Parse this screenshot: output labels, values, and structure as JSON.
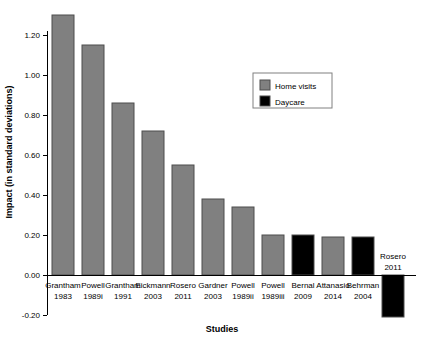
{
  "chart_data": {
    "type": "bar",
    "title": "",
    "xlabel": "Studies",
    "ylabel": "Impact (in standard deviations)",
    "categories": [
      "Grantham 1983",
      "Powell 1989i",
      "Grantham 1991",
      "Eickmann 2003",
      "Rosero 2011",
      "Gardner 2003",
      "Powell 1989ii",
      "Powell 1989iii",
      "Bernal 2009",
      "Attanasio 2014",
      "Behrman 2004",
      "Rosero 2011"
    ],
    "category_lines": [
      [
        "Grantham",
        "1983"
      ],
      [
        "Powell",
        "1989i"
      ],
      [
        "Grantham",
        "1991"
      ],
      [
        "Eickmann",
        "2003"
      ],
      [
        "Rosero",
        "2011"
      ],
      [
        "Gardner",
        "2003"
      ],
      [
        "Powell",
        "1989ii"
      ],
      [
        "Powell",
        "1989iii"
      ],
      [
        "Bernal",
        "2009"
      ],
      [
        "Attanasio",
        "2014"
      ],
      [
        "Behrman",
        "2004"
      ],
      [
        "Rosero",
        "2011"
      ]
    ],
    "values": [
      1.3,
      1.15,
      0.86,
      0.72,
      0.55,
      0.38,
      0.34,
      0.2,
      0.2,
      0.19,
      0.19,
      -0.21
    ],
    "groups": [
      "Home visits",
      "Home visits",
      "Home visits",
      "Home visits",
      "Home visits",
      "Home visits",
      "Home visits",
      "Home visits",
      "Daycare",
      "Home visits",
      "Daycare",
      "Daycare"
    ],
    "ylim": [
      -0.2,
      1.3
    ],
    "yticks": [
      -0.2,
      0.0,
      0.2,
      0.4,
      0.6,
      0.8,
      1.0,
      1.2
    ],
    "ytick_labels": [
      "-0.20",
      "0.00",
      "0.20",
      "0.40",
      "0.60",
      "0.80",
      "1.00",
      "1.20"
    ],
    "grid": false,
    "legend_position": "upper-right"
  },
  "legend": {
    "items": [
      {
        "label": "Home visits",
        "color": "#808080"
      },
      {
        "label": "Daycare",
        "color": "#000000"
      }
    ]
  },
  "colors": {
    "home_visits": "#808080",
    "daycare": "#000000",
    "bar_outline": "#4d4d4d",
    "axis": "#000000",
    "background": "#ffffff"
  }
}
